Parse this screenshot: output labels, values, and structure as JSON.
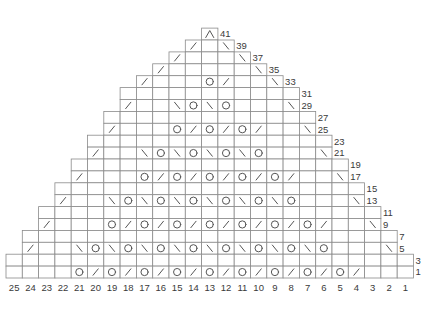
{
  "chart_data": {
    "type": "knitting-chart",
    "title": "",
    "symbol_legend": {
      "": "knit",
      "/": "right-leaning decrease",
      "\\": "left-leaning decrease",
      "O": "yarn over",
      "^": "centered double decrease"
    },
    "column_labels": [
      25,
      24,
      23,
      22,
      21,
      20,
      19,
      18,
      17,
      16,
      15,
      14,
      13,
      12,
      11,
      10,
      9,
      8,
      7,
      6,
      5,
      4,
      3,
      2,
      1
    ],
    "rows": [
      {
        "row": 41,
        "from": 13,
        "to": 13,
        "stitches": [
          "^"
        ]
      },
      {
        "row": 39,
        "from": 14,
        "to": 12,
        "stitches": [
          "/",
          "",
          "\\"
        ]
      },
      {
        "row": 37,
        "from": 15,
        "to": 11,
        "stitches": [
          "/",
          "",
          "",
          "",
          "\\"
        ]
      },
      {
        "row": 35,
        "from": 16,
        "to": 10,
        "stitches": [
          "/",
          "",
          "",
          "",
          "",
          "",
          "\\"
        ]
      },
      {
        "row": 33,
        "from": 17,
        "to": 9,
        "stitches": [
          "/",
          "",
          "",
          "",
          "O",
          "/",
          "",
          "",
          "\\"
        ]
      },
      {
        "row": 31,
        "from": 18,
        "to": 8,
        "stitches": [
          "",
          "",
          "",
          "",
          "",
          "",
          "",
          "",
          "",
          "",
          ""
        ]
      },
      {
        "row": 29,
        "from": 18,
        "to": 8,
        "stitches": [
          "/",
          "",
          "",
          "\\",
          "O",
          "\\",
          "O",
          "",
          "",
          "",
          "\\"
        ]
      },
      {
        "row": 27,
        "from": 19,
        "to": 7,
        "stitches": [
          "",
          "",
          "",
          "",
          "",
          "",
          "",
          "",
          "",
          "",
          "",
          "",
          ""
        ]
      },
      {
        "row": 25,
        "from": 19,
        "to": 7,
        "stitches": [
          "/",
          "",
          "",
          "",
          "O",
          "/",
          "O",
          "/",
          "O",
          "/",
          "",
          "",
          "\\"
        ]
      },
      {
        "row": 23,
        "from": 20,
        "to": 6,
        "stitches": [
          "",
          "",
          "",
          "",
          "",
          "",
          "",
          "",
          "",
          "",
          "",
          "",
          "",
          "",
          ""
        ]
      },
      {
        "row": 21,
        "from": 20,
        "to": 6,
        "stitches": [
          "/",
          "",
          "",
          "\\",
          "O",
          "\\",
          "O",
          "\\",
          "O",
          "\\",
          "O",
          "",
          "",
          "",
          "\\"
        ]
      },
      {
        "row": 19,
        "from": 21,
        "to": 5,
        "stitches": [
          "",
          "",
          "",
          "",
          "",
          "",
          "",
          "",
          "",
          "",
          "",
          "",
          "",
          "",
          "",
          "",
          ""
        ]
      },
      {
        "row": 17,
        "from": 21,
        "to": 5,
        "stitches": [
          "/",
          "",
          "",
          "",
          "O",
          "/",
          "O",
          "/",
          "O",
          "/",
          "O",
          "/",
          "O",
          "/",
          "",
          "",
          "\\"
        ]
      },
      {
        "row": 15,
        "from": 22,
        "to": 4,
        "stitches": [
          "",
          "",
          "",
          "",
          "",
          "",
          "",
          "",
          "",
          "",
          "",
          "",
          "",
          "",
          "",
          "",
          "",
          "",
          ""
        ]
      },
      {
        "row": 13,
        "from": 22,
        "to": 4,
        "stitches": [
          "/",
          "",
          "",
          "\\",
          "O",
          "\\",
          "O",
          "\\",
          "O",
          "\\",
          "O",
          "\\",
          "O",
          "\\",
          "O",
          "",
          "",
          "",
          "\\"
        ]
      },
      {
        "row": 11,
        "from": 23,
        "to": 3,
        "stitches": [
          "",
          "",
          "",
          "",
          "",
          "",
          "",
          "",
          "",
          "",
          "",
          "",
          "",
          "",
          "",
          "",
          "",
          "",
          "",
          "",
          ""
        ]
      },
      {
        "row": 9,
        "from": 23,
        "to": 3,
        "stitches": [
          "/",
          "",
          "",
          "",
          "O",
          "/",
          "O",
          "/",
          "O",
          "/",
          "O",
          "/",
          "O",
          "/",
          "O",
          "/",
          "O",
          "/",
          "",
          "",
          "\\"
        ]
      },
      {
        "row": 7,
        "from": 24,
        "to": 2,
        "stitches": [
          "",
          "",
          "",
          "",
          "",
          "",
          "",
          "",
          "",
          "",
          "",
          "",
          "",
          "",
          "",
          "",
          "",
          "",
          "",
          "",
          "",
          "",
          ""
        ]
      },
      {
        "row": 5,
        "from": 24,
        "to": 2,
        "stitches": [
          "/",
          "",
          "",
          "\\",
          "O",
          "\\",
          "O",
          "\\",
          "O",
          "\\",
          "O",
          "\\",
          "O",
          "\\",
          "O",
          "\\",
          "O",
          "\\",
          "O",
          "",
          "",
          "",
          "\\"
        ]
      },
      {
        "row": 3,
        "from": 25,
        "to": 1,
        "stitches": [
          "",
          "",
          "",
          "",
          "",
          "",
          "",
          "",
          "",
          "",
          "",
          "",
          "",
          "",
          "",
          "",
          "",
          "",
          "",
          "",
          "",
          "",
          "",
          "",
          ""
        ]
      },
      {
        "row": 1,
        "from": 25,
        "to": 1,
        "stitches": [
          "",
          "",
          "",
          "",
          "O",
          "/",
          "O",
          "/",
          "O",
          "/",
          "O",
          "/",
          "O",
          "/",
          "O",
          "/",
          "O",
          "/",
          "O",
          "/",
          "O",
          "/",
          "",
          "",
          ""
        ]
      }
    ]
  }
}
